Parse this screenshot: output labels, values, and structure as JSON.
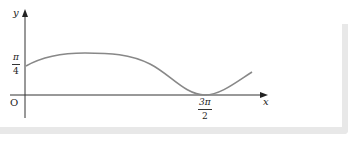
{
  "diagram": {
    "type": "function-graph",
    "axes": {
      "x_label": "x",
      "y_label": "y",
      "origin_label": "O"
    },
    "y_tick": {
      "numerator": "π",
      "denominator": "4",
      "value": "π/4"
    },
    "x_tick": {
      "numerator": "3π",
      "denominator": "2",
      "value": "3π/2"
    },
    "curve": {
      "description": "Curve starts at (0, π/4), rises to a maximum, decreases to touch the x-axis at x = 3π/2, then rises again",
      "color": "#888888"
    },
    "colors": {
      "axis": "#333333",
      "frame": "#e8e8e8"
    }
  }
}
